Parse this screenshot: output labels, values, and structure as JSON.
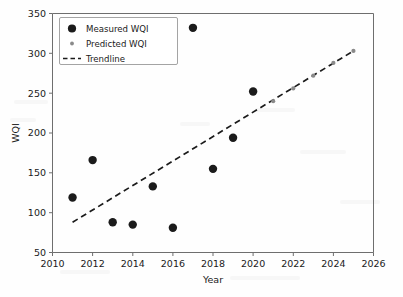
{
  "chart_data": {
    "type": "scatter",
    "title": "",
    "xlabel": "Year",
    "ylabel": "WQI",
    "xlim": [
      2010,
      2026
    ],
    "ylim": [
      50,
      350
    ],
    "xticks": [
      2010,
      2012,
      2014,
      2016,
      2018,
      2020,
      2022,
      2024,
      2026
    ],
    "xtick_labels": [
      "2010",
      "2012",
      "2014",
      "2016",
      "2018",
      "2020",
      "2022",
      "2024",
      "2026"
    ],
    "yticks": [
      50,
      100,
      150,
      200,
      250,
      300,
      350
    ],
    "ytick_labels": [
      "50",
      "100",
      "150",
      "200",
      "250",
      "300",
      "350"
    ],
    "grid": false,
    "legend_position": "upper left",
    "series": [
      {
        "name": "Measured WQI",
        "type": "scatter",
        "marker": "filled-circle",
        "color": "#1b1b1b",
        "x": [
          2011,
          2012,
          2013,
          2014,
          2015,
          2016,
          2017,
          2018,
          2019,
          2020
        ],
        "y": [
          119,
          166,
          88,
          85,
          133,
          81,
          332,
          155,
          194,
          252
        ]
      },
      {
        "name": "Predicted WQI",
        "type": "scatter",
        "marker": "small-dot",
        "color": "#8a8a8a",
        "x": [
          2021,
          2022,
          2023,
          2024,
          2025
        ],
        "y": [
          240,
          256,
          272,
          288,
          303
        ]
      },
      {
        "name": "Trendline",
        "type": "line",
        "style": "dashed",
        "color": "#1b1b1b",
        "x": [
          2011,
          2025
        ],
        "y": [
          88,
          303
        ]
      }
    ]
  },
  "legend": {
    "entries": [
      {
        "label": "Measured WQI",
        "marker": "filled-circle",
        "color": "#1b1b1b"
      },
      {
        "label": "Predicted WQI",
        "marker": "small-dot",
        "color": "#8a8a8a"
      },
      {
        "label": "Trendline",
        "marker": "dashed-line",
        "color": "#1b1b1b"
      }
    ]
  },
  "axes": {
    "x_title": "Year",
    "y_title": "WQI"
  }
}
